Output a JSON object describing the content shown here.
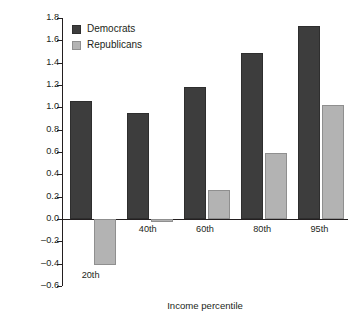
{
  "chart_data": {
    "type": "bar",
    "title": "",
    "subtitle": "",
    "xlabel": "Income percentile",
    "ylabel": "Average annual growth rate (%)",
    "categories": [
      "20th",
      "40th",
      "60th",
      "80th",
      "95th"
    ],
    "series": [
      {
        "name": "Democrats",
        "color": "#3d3d3d",
        "values": [
          1.06,
          0.95,
          1.18,
          1.49,
          1.73
        ]
      },
      {
        "name": "Republicans",
        "color": "#b3b3b3",
        "values": [
          -0.41,
          -0.02,
          0.26,
          0.59,
          1.02
        ]
      }
    ],
    "ylim": [
      -0.6,
      1.8
    ],
    "ytick_labels": [
      "1.8",
      "1.6",
      "1.4",
      "1.2",
      "1.0",
      "0.8",
      "0.6",
      "0.4",
      "0.2",
      "0.0",
      "–0.2",
      "–0.4",
      "–0.6"
    ],
    "ytick_values": [
      1.8,
      1.6,
      1.4,
      1.2,
      1.0,
      0.8,
      0.6,
      0.4,
      0.2,
      0.0,
      -0.2,
      -0.4,
      -0.6
    ],
    "grid": false,
    "legend_position": "top-left",
    "legend_entries": [
      "Democrats",
      "Republicans"
    ]
  }
}
